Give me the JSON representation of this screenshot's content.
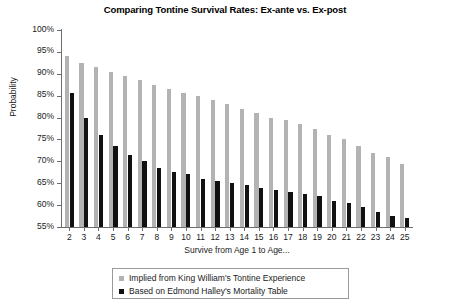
{
  "chart_data": {
    "type": "bar",
    "title": "Comparing Tontine Survival Rates: Ex-ante vs. Ex-post",
    "xlabel": "Survive from Age 1 to Age...",
    "ylabel": "Probability",
    "ylim": [
      55,
      100
    ],
    "ytick_step": 5,
    "ytick_labels": [
      "100%",
      "95%",
      "90%",
      "85%",
      "80%",
      "75%",
      "70%",
      "65%",
      "60%",
      "55%"
    ],
    "ytick_values": [
      100,
      95,
      90,
      85,
      80,
      75,
      70,
      65,
      60,
      55
    ],
    "grid": false,
    "legend_position": "bottom",
    "categories": [
      2,
      3,
      4,
      5,
      6,
      7,
      8,
      9,
      10,
      11,
      12,
      13,
      14,
      15,
      16,
      17,
      18,
      19,
      20,
      21,
      22,
      23,
      24,
      25
    ],
    "category_labels": [
      "2",
      "3",
      "4",
      "5",
      "6",
      "7",
      "8",
      "9",
      "10",
      "11",
      "12",
      "13",
      "14",
      "15",
      "16",
      "17",
      "18",
      "19",
      "20",
      "21",
      "22",
      "23",
      "24",
      "25"
    ],
    "series": [
      {
        "name": "Implied from King William's Tontine Experience",
        "key": "ex-ante",
        "color": "#b3b3b3",
        "values": [
          94.0,
          92.5,
          91.5,
          90.5,
          89.5,
          88.5,
          87.5,
          86.5,
          85.5,
          85.0,
          84.0,
          83.0,
          82.0,
          81.0,
          80.0,
          79.5,
          78.5,
          77.5,
          76.0,
          75.0,
          73.5,
          72.0,
          71.0,
          69.5
        ]
      },
      {
        "name": "Based on Edmond Halley's Mortality Table",
        "key": "ex-post",
        "color": "#111111",
        "values": [
          85.5,
          80.0,
          76.0,
          73.5,
          71.5,
          70.0,
          68.5,
          67.5,
          67.0,
          66.0,
          65.5,
          65.0,
          64.5,
          64.0,
          63.5,
          63.0,
          62.5,
          62.0,
          61.0,
          60.5,
          59.5,
          58.5,
          57.5,
          57.0
        ]
      }
    ]
  },
  "legend": {
    "items": [
      {
        "label": "Implied from King William's Tontine Experience",
        "swatch": "ex-ante"
      },
      {
        "label": "Based on Edmond Halley's Mortality Table",
        "swatch": "ex-post"
      }
    ]
  }
}
